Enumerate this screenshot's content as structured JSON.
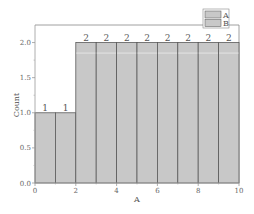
{
  "chart_data": {
    "type": "bar",
    "subtype": "histogram",
    "title": "",
    "xlabel": "A",
    "ylabel": "Count",
    "xlim": [
      0,
      10
    ],
    "ylim": [
      0,
      2.25
    ],
    "x_ticks": [
      "0",
      "2",
      "4",
      "6",
      "8",
      "10"
    ],
    "y_ticks": [
      "0.0",
      "0.5",
      "1.0",
      "1.5",
      "2.0"
    ],
    "bin_edges": [
      0,
      1,
      2,
      3,
      4,
      5,
      6,
      7,
      8,
      9,
      10
    ],
    "categories": [
      "0-1",
      "1-2",
      "2-3",
      "3-4",
      "4-5",
      "5-6",
      "6-7",
      "7-8",
      "8-9",
      "9-10"
    ],
    "series": [
      {
        "name": "A",
        "values": [
          1,
          1,
          2,
          2,
          2,
          2,
          2,
          2,
          2,
          2
        ],
        "color": "#c8c8c8"
      },
      {
        "name": "B",
        "values": [
          1,
          1,
          2,
          2,
          2,
          2,
          2,
          2,
          2,
          2
        ],
        "color": "#c8c8c8"
      }
    ],
    "data_labels": [
      "1",
      "1",
      "2",
      "2",
      "2",
      "2",
      "2",
      "2",
      "2",
      "2"
    ],
    "grid": false,
    "legend_position": "top-right"
  },
  "legend": {
    "items": [
      {
        "label": "A"
      },
      {
        "label": "B"
      }
    ]
  },
  "colors": {
    "bar_fill": "#c8c8c8",
    "bar_edge": "#5a5a5a",
    "axis": "#999999"
  }
}
